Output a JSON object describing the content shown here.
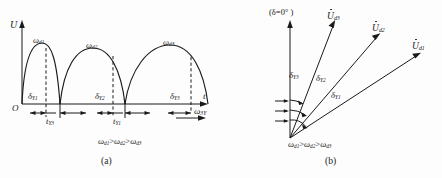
{
  "figure": {
    "panel_a": {
      "caption": "(a)",
      "axis_y_label": "U",
      "axis_y_sub": "",
      "origin_label": "O",
      "axis_t_label": "t",
      "axis_omega_label": "ω",
      "axis_omega_sub": "3Y",
      "peak_labels": [
        {
          "base": "ω",
          "sub": "d1"
        },
        {
          "base": "ω",
          "sub": "d2"
        },
        {
          "base": "ω",
          "sub": "d3"
        }
      ],
      "delta_labels": [
        {
          "base": "δ",
          "sub": "Y1"
        },
        {
          "base": "δ",
          "sub": "Y2"
        },
        {
          "base": "δ",
          "sub": "Y3"
        }
      ],
      "time_labels": [
        {
          "base": "t",
          "sub": "Y3"
        },
        {
          "base": "t",
          "sub": "Y1"
        }
      ],
      "inequality": "ωd1>ωd2>ωd3",
      "inequality_parts": [
        {
          "base": "ω",
          "sub": "d1"
        },
        {
          "op": ">"
        },
        {
          "base": "ω",
          "sub": "d2"
        },
        {
          "op": ">"
        },
        {
          "base": "ω",
          "sub": "d3"
        }
      ]
    },
    "panel_b": {
      "caption": "(b)",
      "reference_label": "(δ=0° )",
      "vector_labels": [
        {
          "base": "U",
          "sub": "d3"
        },
        {
          "base": "U",
          "sub": "d2"
        },
        {
          "base": "U",
          "sub": "d1"
        }
      ],
      "angle_labels": [
        {
          "base": "δ",
          "sub": "Y3"
        },
        {
          "base": "δ",
          "sub": "Y2"
        },
        {
          "base": "δ",
          "sub": "Y1"
        }
      ],
      "inequality_parts": [
        {
          "base": "ω",
          "sub": "d1"
        },
        {
          "op": ">"
        },
        {
          "base": "ω",
          "sub": "d2"
        },
        {
          "op": ">"
        },
        {
          "base": "ω",
          "sub": "d3"
        }
      ]
    },
    "colors": {
      "stroke": "#1a1a1a",
      "text": "#1a1a1a",
      "background": "#fdfdfd"
    }
  }
}
